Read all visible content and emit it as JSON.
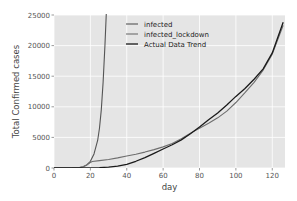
{
  "chart_data": {
    "type": "line",
    "title": "",
    "xlabel": "day",
    "ylabel": "Total Confirmed cases",
    "xlim": [
      0,
      127
    ],
    "ylim": [
      0,
      25000
    ],
    "xticks": [
      0,
      20,
      40,
      60,
      80,
      100,
      120
    ],
    "xtick_labels": [
      "0",
      "20",
      "40",
      "60",
      "80",
      "100",
      "120"
    ],
    "yticks": [
      0,
      5000,
      10000,
      15000,
      20000,
      25000
    ],
    "ytick_labels": [
      "0",
      "5000",
      "10000",
      "15000",
      "20000",
      "25000"
    ],
    "grid": true,
    "legend_position": "top-center",
    "background_color": "#e5e5e5",
    "series": [
      {
        "name": "infected",
        "color": "#555555",
        "x": [
          0,
          5,
          10,
          14,
          16,
          18,
          20,
          22,
          24,
          25,
          26,
          27,
          28,
          29
        ],
        "y": [
          0,
          5,
          20,
          80,
          200,
          500,
          1100,
          2300,
          4500,
          6500,
          9500,
          14000,
          20000,
          27000
        ]
      },
      {
        "name": "infected_lockdown",
        "color": "#6e6e6e",
        "x": [
          0,
          5,
          10,
          14,
          16,
          18,
          20,
          21,
          25,
          30,
          35,
          40,
          45,
          50,
          55,
          60,
          65,
          70,
          75,
          80,
          85,
          90,
          95,
          100,
          105,
          110,
          115,
          120,
          126
        ],
        "y": [
          0,
          5,
          20,
          80,
          200,
          500,
          900,
          1050,
          1200,
          1400,
          1650,
          1950,
          2250,
          2600,
          3000,
          3450,
          4000,
          4800,
          5700,
          6500,
          7300,
          8200,
          9300,
          10700,
          12300,
          14000,
          16000,
          18600,
          23300
        ]
      },
      {
        "name": "Actual Data Trend",
        "color": "#1a1a1a",
        "x": [
          0,
          10,
          20,
          25,
          30,
          35,
          40,
          45,
          50,
          55,
          60,
          65,
          70,
          75,
          80,
          85,
          90,
          95,
          100,
          105,
          110,
          115,
          120,
          126
        ],
        "y": [
          0,
          0,
          20,
          60,
          150,
          300,
          600,
          1100,
          1700,
          2400,
          3100,
          3800,
          4600,
          5600,
          6700,
          7900,
          9000,
          10300,
          11700,
          13000,
          14500,
          16200,
          18800,
          23800
        ]
      }
    ]
  }
}
